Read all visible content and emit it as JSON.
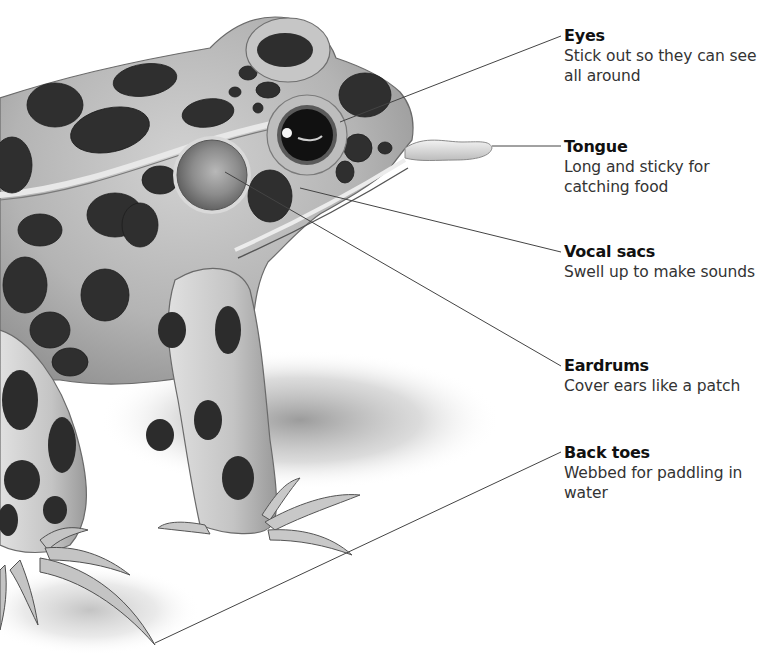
{
  "diagram": {
    "labels": [
      {
        "id": "eyes",
        "title": "Eyes",
        "description": "Stick out so they can see all around"
      },
      {
        "id": "tongue",
        "title": "Tongue",
        "description": "Long and sticky for catching food"
      },
      {
        "id": "vocal_sacs",
        "title": "Vocal sacs",
        "description": "Swell up to make sounds"
      },
      {
        "id": "eardrums",
        "title": "Eardrums",
        "description": "Cover ears like a patch"
      },
      {
        "id": "back_toes",
        "title": "Back toes",
        "description": "Webbed for paddling in water"
      }
    ]
  },
  "colors": {
    "background": "#ffffff",
    "skin": "#b9b9b9",
    "spot": "#2f2f2f",
    "leader_line": "#444444",
    "text": "#2b2b2b"
  }
}
